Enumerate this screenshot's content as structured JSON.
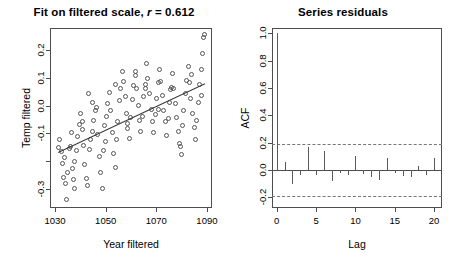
{
  "figure": {
    "background": "#ffffff",
    "foreground": "#000000",
    "point_color": "#545454",
    "line_color": "#3a3a3a",
    "band_color": "#777777"
  },
  "chart_data": [
    {
      "type": "scatter",
      "panel": "left",
      "title": "Fit on filtered scale, r = 0.612",
      "title_prefix": "Fit on filtered scale, ",
      "title_stat_symbol": "r",
      "title_stat_rest": " = 0.612",
      "correlation": 0.612,
      "xlabel": "Year filtered",
      "ylabel": "Temp filtered",
      "xlim": [
        1028,
        1092
      ],
      "ylim": [
        -0.37,
        0.28
      ],
      "xticks": [
        1030,
        1050,
        1070,
        1090
      ],
      "xticklabels": [
        "1030",
        "1050",
        "1070",
        "1090"
      ],
      "yticks": [
        0.2,
        0.1,
        0.0,
        -0.1,
        -0.2,
        -0.3
      ],
      "yticklabels": [
        "0.2",
        "0.1",
        "0.0",
        "-0.1",
        "",
        "-0.3"
      ],
      "grid": false,
      "legend": "none",
      "marker": "open-circle",
      "fit_line": {
        "type": "linear-regression",
        "x_start": 1031.0,
        "y_start": -0.168,
        "x_end": 1089.0,
        "y_end": 0.08
      },
      "x": [
        1031.4,
        1032.1,
        1032.6,
        1033.1,
        1033.6,
        1034.2,
        1034.8,
        1035.2,
        1035.8,
        1036.3,
        1036.9,
        1037.4,
        1038.0,
        1038.6,
        1039.1,
        1039.7,
        1040.3,
        1040.9,
        1041.4,
        1042.0,
        1042.6,
        1043.1,
        1043.7,
        1044.3,
        1044.8,
        1045.4,
        1046.0,
        1046.5,
        1047.1,
        1047.7,
        1048.2,
        1048.8,
        1049.4,
        1049.9,
        1050.5,
        1051.1,
        1051.6,
        1052.2,
        1052.8,
        1053.3,
        1053.9,
        1054.5,
        1055.0,
        1055.6,
        1056.2,
        1056.7,
        1057.3,
        1057.9,
        1058.4,
        1059.0,
        1059.6,
        1060.1,
        1060.7,
        1061.3,
        1061.8,
        1062.4,
        1063.0,
        1063.5,
        1064.1,
        1064.7,
        1065.2,
        1065.8,
        1066.4,
        1066.9,
        1067.5,
        1068.1,
        1068.6,
        1069.2,
        1069.8,
        1070.3,
        1070.9,
        1071.5,
        1072.0,
        1072.6,
        1073.2,
        1073.7,
        1074.3,
        1074.9,
        1075.4,
        1076.0,
        1076.6,
        1077.1,
        1077.7,
        1078.3,
        1078.8,
        1079.4,
        1080.0,
        1080.5,
        1081.1,
        1081.7,
        1082.2,
        1082.8,
        1083.4,
        1083.9,
        1084.5,
        1085.1,
        1085.6,
        1086.2,
        1086.8,
        1087.3,
        1087.9,
        1088.5,
        1089.0,
        1089.4,
        1033.9,
        1037.7,
        1041.1,
        1045.1,
        1050.2,
        1054.2,
        1058.7,
        1062.1,
        1066.1,
        1071.2,
        1075.7,
        1079.7,
        1084.2,
        1088.2,
        1036.6,
        1043.4
      ],
      "y": [
        -0.155,
        -0.125,
        -0.168,
        -0.21,
        -0.262,
        -0.285,
        -0.34,
        -0.245,
        -0.158,
        -0.148,
        -0.23,
        -0.27,
        -0.3,
        -0.165,
        -0.115,
        -0.07,
        -0.03,
        -0.06,
        -0.145,
        -0.215,
        -0.265,
        -0.29,
        -0.16,
        -0.125,
        -0.095,
        -0.055,
        -0.02,
        -0.01,
        -0.105,
        -0.185,
        -0.245,
        -0.3,
        -0.165,
        -0.075,
        -0.04,
        0.005,
        0.045,
        -0.02,
        -0.1,
        -0.175,
        -0.225,
        -0.125,
        -0.06,
        0.015,
        0.06,
        0.12,
        0.085,
        0.03,
        -0.03,
        -0.085,
        -0.12,
        -0.045,
        0.02,
        0.07,
        0.105,
        0.06,
        0.0,
        -0.055,
        -0.095,
        -0.04,
        0.03,
        0.075,
        0.15,
        0.095,
        0.04,
        -0.015,
        -0.06,
        -0.1,
        -0.035,
        0.025,
        0.08,
        0.13,
        0.085,
        0.035,
        -0.02,
        -0.06,
        -0.11,
        -0.05,
        0.01,
        0.065,
        0.115,
        0.06,
        0.005,
        -0.045,
        -0.095,
        -0.14,
        -0.18,
        -0.075,
        -0.02,
        0.04,
        0.09,
        0.14,
        0.08,
        0.025,
        -0.03,
        -0.08,
        -0.125,
        -0.055,
        0.01,
        0.075,
        0.13,
        0.185,
        0.245,
        0.255,
        -0.19,
        -0.205,
        -0.09,
        0.01,
        -0.13,
        0.075,
        -0.065,
        0.12,
        0.06,
        -0.015,
        0.055,
        -0.15,
        0.11,
        0.035,
        -0.1,
        0.04
      ]
    },
    {
      "type": "bar",
      "panel": "right",
      "title": "Series  residuals",
      "xlabel": "Lag",
      "ylabel": "ACF",
      "xlim": [
        -0.6,
        21.0
      ],
      "ylim": [
        -0.28,
        1.04
      ],
      "xticks": [
        0,
        5,
        10,
        15,
        20
      ],
      "xticklabels": [
        "0",
        "5",
        "10",
        "15",
        "20"
      ],
      "yticks": [
        1.0,
        0.8,
        0.6,
        0.4,
        0.2,
        0.0,
        -0.2
      ],
      "yticklabels": [
        "1.0",
        "0.8",
        "0.6",
        "0.4",
        "0.2",
        "0.0",
        "-0.2"
      ],
      "grid": false,
      "legend": "none",
      "confidence_bands": [
        0.19,
        -0.19
      ],
      "categories": [
        0,
        1,
        2,
        3,
        4,
        5,
        6,
        7,
        8,
        9,
        10,
        11,
        12,
        13,
        14,
        15,
        16,
        17,
        18,
        19,
        20
      ],
      "values": [
        1.0,
        0.055,
        -0.105,
        -0.04,
        0.165,
        -0.035,
        0.135,
        -0.08,
        -0.02,
        -0.04,
        0.105,
        -0.03,
        -0.055,
        -0.075,
        0.085,
        -0.025,
        -0.045,
        -0.05,
        0.03,
        -0.04,
        0.09
      ]
    }
  ]
}
